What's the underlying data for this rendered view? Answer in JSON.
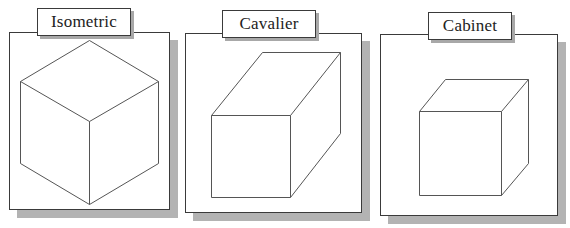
{
  "diagram": {
    "title_panels": [
      {
        "label": "Isometric",
        "projection": "isometric",
        "shape": "cube"
      },
      {
        "label": "Cavalier",
        "projection": "cavalier",
        "shape": "box (full-depth receding edges)"
      },
      {
        "label": "Cabinet",
        "projection": "cabinet",
        "shape": "cube (half-depth receding edges)"
      }
    ],
    "colors": {
      "background": "#ffffff",
      "panel_border": "#3a3a3a",
      "shadow": "#b3b3b3",
      "cube_stroke": "#555555"
    }
  }
}
